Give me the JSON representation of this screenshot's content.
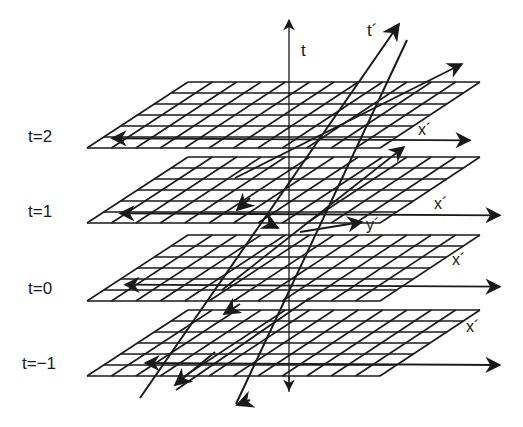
{
  "diagram": {
    "axis_label": "t",
    "tilted_axis_label": "t´",
    "planes": [
      {
        "label": "t=2",
        "x_label": "x´",
        "top_y": 82,
        "height": 66
      },
      {
        "label": "t=1",
        "x_label": "x´",
        "top_y": 157,
        "height": 66
      },
      {
        "label": "t=0",
        "x_label": "x´",
        "top_y": 235,
        "height": 66
      },
      {
        "label": "t=−1",
        "x_label": "x´",
        "top_y": 310,
        "height": 66
      }
    ],
    "y_label": "y´",
    "grid": {
      "rows": 6,
      "cols": 12
    },
    "colors": {
      "ink": "#1a1a1a",
      "background": "#ffffff"
    }
  }
}
